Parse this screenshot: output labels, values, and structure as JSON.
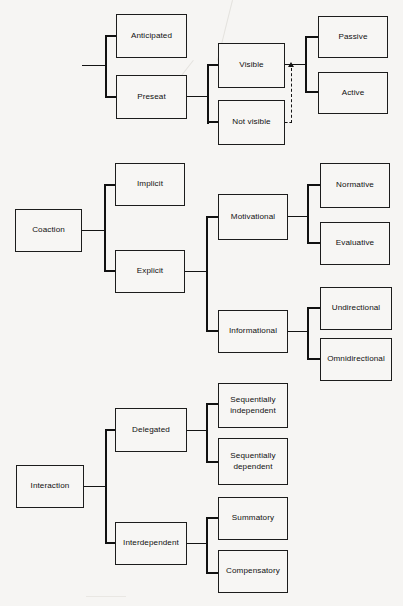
{
  "figure": {
    "background_color": "#f6f5f3",
    "line_color": "#111111",
    "box_border_color": "#1c1c1c",
    "box_fill_color": "#f7f6f4"
  },
  "sections": [
    {
      "id": "audience",
      "root": {
        "label": "Audience",
        "x": 15,
        "y": 44,
        "w": 67,
        "h": 44
      },
      "level1": [
        {
          "label": "Anticipated",
          "x": 116,
          "y": 14,
          "w": 71,
          "h": 44
        },
        {
          "label": "Preseat",
          "x": 116,
          "y": 75,
          "w": 71,
          "h": 44
        }
      ],
      "level2": [
        {
          "label": "Visible",
          "x": 218,
          "y": 43,
          "w": 67,
          "h": 45
        },
        {
          "label": "Not visible",
          "x": 218,
          "y": 100,
          "w": 67,
          "h": 45
        }
      ],
      "level3": [
        {
          "label": "Passive",
          "x": 318,
          "y": 16,
          "w": 70,
          "h": 42
        },
        {
          "label": "Active",
          "x": 318,
          "y": 72,
          "w": 70,
          "h": 42
        }
      ],
      "feedback_arrow": {
        "from": "Not visible",
        "to": "Passive / Active junction",
        "style": "dashed",
        "direction": "up"
      }
    },
    {
      "id": "coaction",
      "root": {
        "label": "Coaction",
        "x": 15,
        "y": 209,
        "w": 67,
        "h": 43
      },
      "level1": [
        {
          "label": "Implicit",
          "x": 115,
          "y": 163,
          "w": 70,
          "h": 43
        },
        {
          "label": "Explicit",
          "x": 115,
          "y": 250,
          "w": 70,
          "h": 43
        }
      ],
      "level2": [
        {
          "label": "Motivational",
          "x": 218,
          "y": 194,
          "w": 70,
          "h": 46
        },
        {
          "label": "Informational",
          "x": 218,
          "y": 310,
          "w": 70,
          "h": 43
        }
      ],
      "level3_motivational": [
        {
          "label": "Normative",
          "x": 320,
          "y": 163,
          "w": 70,
          "h": 45
        },
        {
          "label": "Evaluative",
          "x": 320,
          "y": 222,
          "w": 70,
          "h": 43
        }
      ],
      "level3_informational": [
        {
          "label": "Undirectional",
          "x": 320,
          "y": 287,
          "w": 72,
          "h": 43
        },
        {
          "label": "Omnidirectional",
          "x": 320,
          "y": 338,
          "w": 72,
          "h": 43
        }
      ]
    },
    {
      "id": "interaction",
      "root": {
        "label": "Interaction",
        "x": 16,
        "y": 465,
        "w": 68,
        "h": 43
      },
      "level1": [
        {
          "label": "Delegated",
          "x": 115,
          "y": 408,
          "w": 72,
          "h": 44
        },
        {
          "label": "Interdependent",
          "x": 115,
          "y": 522,
          "w": 72,
          "h": 43
        }
      ],
      "level2_delegated": [
        {
          "label": "Sequentially\nindependent",
          "x": 218,
          "y": 383,
          "w": 70,
          "h": 45
        },
        {
          "label": "Sequentially\ndependent",
          "x": 218,
          "y": 438,
          "w": 70,
          "h": 47
        }
      ],
      "level2_interdependent": [
        {
          "label": "Summatory",
          "x": 218,
          "y": 497,
          "w": 70,
          "h": 43
        },
        {
          "label": "Compensatory",
          "x": 218,
          "y": 550,
          "w": 70,
          "h": 43
        }
      ]
    }
  ]
}
